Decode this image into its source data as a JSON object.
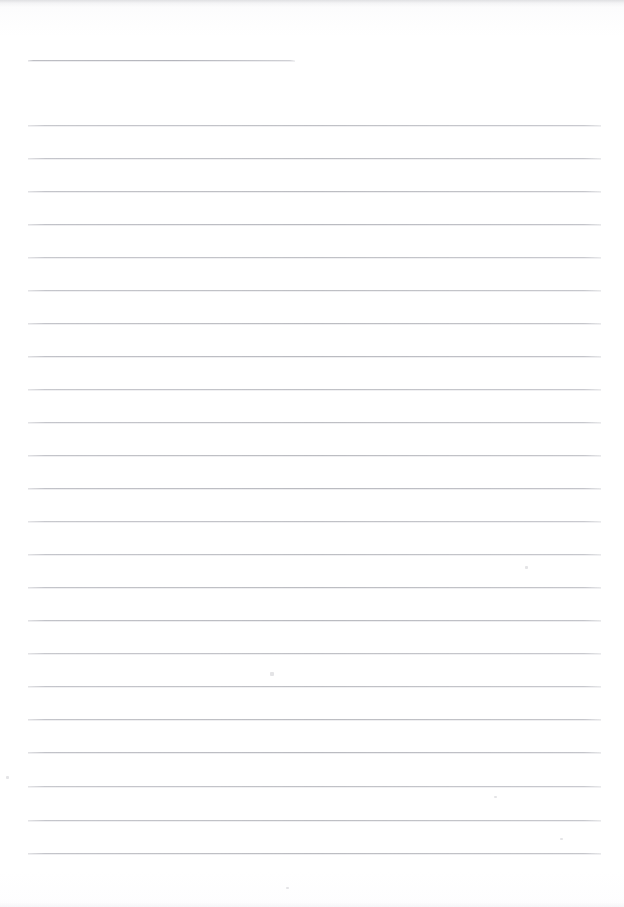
{
  "document": {
    "type": "scanned-lined-notebook-page",
    "title": "Blank ruled page",
    "page_width": 624,
    "page_height": 907,
    "background_color": "#ffffff",
    "rule_color": "#b8b9bf",
    "text_content": "",
    "visible_text": []
  },
  "rules": {
    "left_margin_x": 28,
    "right_edge_x": 601,
    "line_pitch": 33,
    "short_rule": {
      "label": "header-rule",
      "x_start": 28,
      "x_end": 295,
      "y": 60
    },
    "full_rules_y": [
      125,
      158,
      191,
      224,
      257,
      290,
      323,
      356,
      389,
      422,
      455,
      488,
      521,
      554,
      587,
      620,
      653,
      686,
      719,
      752,
      786,
      820,
      853
    ],
    "full_rule_count": 23
  },
  "artifacts": {
    "top_edge_smudge": true,
    "specks": [
      {
        "x": 270,
        "y": 672,
        "w": 4,
        "h": 4
      },
      {
        "x": 525,
        "y": 566,
        "w": 3,
        "h": 3
      },
      {
        "x": 6,
        "y": 776,
        "w": 3,
        "h": 3
      },
      {
        "x": 494,
        "y": 796,
        "w": 3,
        "h": 2
      },
      {
        "x": 560,
        "y": 838,
        "w": 3,
        "h": 2
      },
      {
        "x": 286,
        "y": 887,
        "w": 3,
        "h": 2
      }
    ]
  }
}
